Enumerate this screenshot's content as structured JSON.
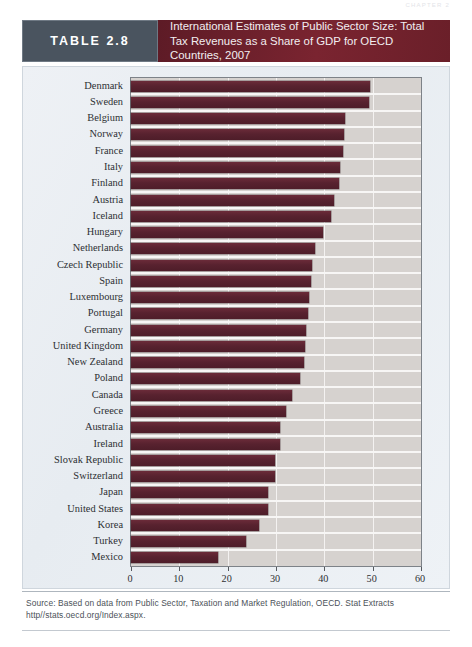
{
  "running_head": "CHAPTER 2",
  "banner": {
    "table_label": "TABLE 2.8",
    "title": "International Estimates of Public Sector Size: Total Tax Revenues as a Share of GDP for OECD Countries, 2007",
    "label_bg": "#4a545f",
    "title_bg": "#6d1f2a"
  },
  "source": {
    "text": "Source: Based on data from Public Sector, Taxation and Market Regulation, OECD. Stat Extracts http//stats.oecd.org/Index.aspx."
  },
  "chart_data": {
    "type": "bar",
    "orientation": "horizontal",
    "title": "International Estimates of Public Sector Size: Total Tax Revenues as a Share of GDP for OECD Countries, 2007",
    "xlabel": "",
    "ylabel": "",
    "xlim": [
      0,
      60
    ],
    "xticks": [
      0,
      10,
      20,
      30,
      40,
      50,
      60
    ],
    "grid": true,
    "legend": false,
    "bar_color": "#5c2432",
    "plot_bg": "#d6d2cf",
    "categories": [
      "Denmark",
      "Sweden",
      "Belgium",
      "Norway",
      "France",
      "Italy",
      "Finland",
      "Austria",
      "Iceland",
      "Hungary",
      "Netherlands",
      "Czech Republic",
      "Spain",
      "Luxembourg",
      "Portugal",
      "Germany",
      "United Kingdom",
      "New Zealand",
      "Poland",
      "Canada",
      "Greece",
      "Australia",
      "Ireland",
      "Slovak Republic",
      "Switzerland",
      "Japan",
      "United States",
      "Korea",
      "Turkey",
      "Mexico"
    ],
    "values": [
      49.5,
      49.3,
      44.3,
      44.0,
      43.9,
      43.3,
      43.0,
      42.1,
      41.4,
      39.8,
      38.0,
      37.4,
      37.2,
      36.9,
      36.6,
      36.2,
      36.1,
      35.7,
      34.9,
      33.3,
      32.0,
      30.8,
      30.8,
      29.8,
      29.7,
      28.3,
      28.3,
      26.5,
      23.7,
      18.0
    ],
    "value_unit": "% of GDP"
  }
}
